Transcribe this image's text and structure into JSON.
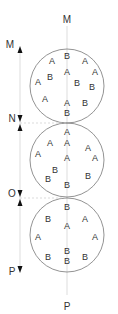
{
  "axis_labels": {
    "top": "M",
    "bottom": "P"
  },
  "side_markers": [
    {
      "label": "M",
      "y": 45
    },
    {
      "label": "N",
      "y": 118
    },
    {
      "label": "O",
      "y": 192
    },
    {
      "label": "P",
      "y": 272
    }
  ],
  "circles": [
    {
      "name": "top-circle",
      "letters": [
        {
          "t": "B",
          "x": 67,
          "y": 59
        },
        {
          "t": "A",
          "x": 52,
          "y": 64
        },
        {
          "t": "A",
          "x": 85,
          "y": 64
        },
        {
          "t": "A",
          "x": 67,
          "y": 75
        },
        {
          "t": "A",
          "x": 95,
          "y": 75
        },
        {
          "t": "B",
          "x": 50,
          "y": 80
        },
        {
          "t": "A",
          "x": 38,
          "y": 85
        },
        {
          "t": "B",
          "x": 77,
          "y": 86
        },
        {
          "t": "B",
          "x": 92,
          "y": 90
        },
        {
          "t": "A",
          "x": 45,
          "y": 102
        },
        {
          "t": "A",
          "x": 67,
          "y": 106
        },
        {
          "t": "B",
          "x": 85,
          "y": 106
        },
        {
          "t": "B",
          "x": 67,
          "y": 116
        }
      ]
    },
    {
      "name": "middle-circle",
      "letters": [
        {
          "t": "A",
          "x": 67,
          "y": 135
        },
        {
          "t": "A",
          "x": 50,
          "y": 146
        },
        {
          "t": "A",
          "x": 67,
          "y": 146
        },
        {
          "t": "A",
          "x": 88,
          "y": 151
        },
        {
          "t": "A",
          "x": 38,
          "y": 157
        },
        {
          "t": "A",
          "x": 95,
          "y": 161
        },
        {
          "t": "A",
          "x": 67,
          "y": 161
        },
        {
          "t": "B",
          "x": 55,
          "y": 173
        },
        {
          "t": "B",
          "x": 48,
          "y": 182
        },
        {
          "t": "B",
          "x": 88,
          "y": 179
        },
        {
          "t": "B",
          "x": 67,
          "y": 188
        }
      ]
    },
    {
      "name": "bottom-circle",
      "letters": [
        {
          "t": "B",
          "x": 67,
          "y": 210
        },
        {
          "t": "B",
          "x": 48,
          "y": 222
        },
        {
          "t": "A",
          "x": 67,
          "y": 229
        },
        {
          "t": "A",
          "x": 85,
          "y": 222
        },
        {
          "t": "A",
          "x": 38,
          "y": 240
        },
        {
          "t": "A",
          "x": 95,
          "y": 240
        },
        {
          "t": "B",
          "x": 67,
          "y": 254
        },
        {
          "t": "B",
          "x": 67,
          "y": 264
        },
        {
          "t": "B",
          "x": 48,
          "y": 260
        },
        {
          "t": "B",
          "x": 85,
          "y": 260
        }
      ]
    }
  ],
  "colors": {
    "stroke": "#666666",
    "text": "#333333",
    "guide": "#cccccc"
  }
}
